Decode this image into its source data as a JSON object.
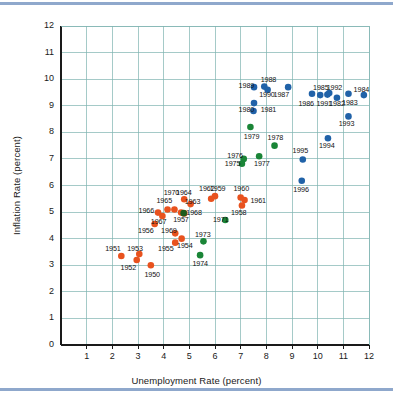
{
  "figure": {
    "background_color": "#ffffff",
    "rule_color": "#8fa8cc",
    "plot": {
      "border_color": "#1a1a1a",
      "grid_color": "#7fb3b0",
      "xlim": [
        0,
        12
      ],
      "ylim": [
        0,
        12
      ]
    }
  },
  "chart_data": {
    "type": "scatter",
    "title": "",
    "xlabel": "Unemployment Rate (percent)",
    "ylabel": "Inflation Rate (percent)",
    "xlim": [
      0,
      12
    ],
    "ylim": [
      0,
      12
    ],
    "xticks": [
      1,
      2,
      3,
      4,
      5,
      6,
      7,
      8,
      9,
      10,
      11,
      12
    ],
    "yticks": [
      0,
      1,
      2,
      3,
      4,
      5,
      6,
      7,
      8,
      9,
      10,
      11,
      12
    ],
    "grid": true,
    "legend": "none",
    "series": [
      {
        "name": "1950s-1960s",
        "color": "#e8521e",
        "points": [
          {
            "label": "1950",
            "x": 3.5,
            "y": 3.0,
            "lx": 3.25,
            "ly": 2.62
          },
          {
            "label": "1951",
            "x": 2.35,
            "y": 3.35,
            "lx": 1.72,
            "ly": 3.62
          },
          {
            "label": "1952",
            "x": 2.95,
            "y": 3.2,
            "lx": 2.32,
            "ly": 2.9
          },
          {
            "label": "1953",
            "x": 3.05,
            "y": 3.42,
            "lx": 2.58,
            "ly": 3.62
          },
          {
            "label": "1954",
            "x": 4.7,
            "y": 4.0,
            "lx": 4.52,
            "ly": 3.72
          },
          {
            "label": "1955",
            "x": 4.45,
            "y": 3.85,
            "lx": 3.78,
            "ly": 3.6
          },
          {
            "label": "1956",
            "x": 3.65,
            "y": 4.55,
            "lx": 3.0,
            "ly": 4.28
          },
          {
            "label": "1957",
            "x": 4.68,
            "y": 4.98,
            "lx": 4.37,
            "ly": 4.7
          },
          {
            "label": "1958",
            "x": 7.05,
            "y": 5.25,
            "lx": 6.62,
            "ly": 4.95
          },
          {
            "label": "1959",
            "x": 6.0,
            "y": 5.6,
            "lx": 5.8,
            "ly": 5.88
          },
          {
            "label": "1960",
            "x": 7.0,
            "y": 5.55,
            "lx": 6.72,
            "ly": 5.88
          },
          {
            "label": "1961",
            "x": 7.15,
            "y": 5.45,
            "lx": 7.38,
            "ly": 5.4
          },
          {
            "label": "1962",
            "x": 5.85,
            "y": 5.5,
            "lx": 5.38,
            "ly": 5.88
          },
          {
            "label": "1963",
            "x": 5.05,
            "y": 5.3,
            "lx": 4.82,
            "ly": 5.38
          },
          {
            "label": "1964",
            "x": 4.8,
            "y": 5.48,
            "lx": 4.48,
            "ly": 5.72
          },
          {
            "label": "1965",
            "x": 4.15,
            "y": 5.1,
            "lx": 3.72,
            "ly": 5.4
          },
          {
            "label": "1966",
            "x": 3.78,
            "y": 4.98,
            "lx": 3.02,
            "ly": 5.05
          },
          {
            "label": "1967",
            "x": 3.95,
            "y": 4.85,
            "lx": 3.5,
            "ly": 4.62
          },
          {
            "label": "1968",
            "x": 4.8,
            "y": 4.95,
            "lx": 4.88,
            "ly": 4.95
          },
          {
            "label": "1969",
            "x": 4.45,
            "y": 4.2,
            "lx": 3.9,
            "ly": 4.3
          },
          {
            "label": "1970",
            "x": 4.42,
            "y": 5.1,
            "lx": 4.0,
            "ly": 5.72
          }
        ]
      },
      {
        "name": "1970s",
        "color": "#1a8537",
        "points": [
          {
            "label": "1971",
            "x": 6.4,
            "y": 4.7,
            "lx": 5.92,
            "ly": 4.72
          },
          {
            "label": "1973",
            "x": 5.55,
            "y": 3.9,
            "lx": 5.22,
            "ly": 4.15
          },
          {
            "label": "1974",
            "x": 5.42,
            "y": 3.38,
            "lx": 5.12,
            "ly": 3.05
          },
          {
            "label": "1975",
            "x": 7.05,
            "y": 6.82,
            "lx": 6.38,
            "ly": 6.82
          },
          {
            "label": "1976",
            "x": 7.12,
            "y": 7.0,
            "lx": 6.48,
            "ly": 7.12
          },
          {
            "label": "1977",
            "x": 7.72,
            "y": 7.1,
            "lx": 7.52,
            "ly": 6.82
          },
          {
            "label": "1978",
            "x": 8.32,
            "y": 7.5,
            "lx": 8.05,
            "ly": 7.78
          },
          {
            "label": "1979",
            "x": 7.38,
            "y": 8.2,
            "lx": 7.12,
            "ly": 7.82
          }
        ]
      },
      {
        "name": "1980s-1990s",
        "color": "#2062a8",
        "points": [
          {
            "label": "1980",
            "x": 7.5,
            "y": 8.8,
            "lx": 6.92,
            "ly": 8.85
          },
          {
            "label": "1981",
            "x": 7.52,
            "y": 9.1,
            "lx": 7.78,
            "ly": 8.85
          },
          {
            "label": "1982",
            "x": 10.75,
            "y": 9.3,
            "lx": 10.45,
            "ly": 9.05
          },
          {
            "label": "1983",
            "x": 11.2,
            "y": 9.45,
            "lx": 10.95,
            "ly": 9.1
          },
          {
            "label": "1984",
            "x": 11.8,
            "y": 9.4,
            "lx": 11.4,
            "ly": 9.6
          },
          {
            "label": "1985",
            "x": 10.1,
            "y": 9.4,
            "lx": 9.82,
            "ly": 9.65
          },
          {
            "label": "1986",
            "x": 9.78,
            "y": 9.45,
            "lx": 9.25,
            "ly": 9.08
          },
          {
            "label": "1987",
            "x": 8.85,
            "y": 9.7,
            "lx": 8.28,
            "ly": 9.42
          },
          {
            "label": "1988",
            "x": 7.92,
            "y": 9.72,
            "lx": 7.78,
            "ly": 9.98
          },
          {
            "label": "1989",
            "x": 7.52,
            "y": 9.7,
            "lx": 6.92,
            "ly": 9.75
          },
          {
            "label": "1990",
            "x": 8.05,
            "y": 9.6,
            "lx": 7.72,
            "ly": 9.4
          },
          {
            "label": "1991",
            "x": 10.38,
            "y": 9.42,
            "lx": 9.95,
            "ly": 9.08
          },
          {
            "label": "1992",
            "x": 10.45,
            "y": 9.48,
            "lx": 10.35,
            "ly": 9.68
          },
          {
            "label": "1993",
            "x": 11.2,
            "y": 8.6,
            "lx": 10.82,
            "ly": 8.32
          },
          {
            "label": "1994",
            "x": 10.4,
            "y": 7.78,
            "lx": 10.05,
            "ly": 7.48
          },
          {
            "label": "1995",
            "x": 9.42,
            "y": 6.98,
            "lx": 9.02,
            "ly": 7.3
          },
          {
            "label": "1996",
            "x": 9.38,
            "y": 6.18,
            "lx": 9.05,
            "ly": 5.82
          }
        ]
      },
      {
        "name": "overlap-marker",
        "color": "#1d5b1d",
        "points": [
          {
            "label": "",
            "x": 4.78,
            "y": 4.96,
            "lx": null,
            "ly": null
          }
        ]
      }
    ]
  }
}
